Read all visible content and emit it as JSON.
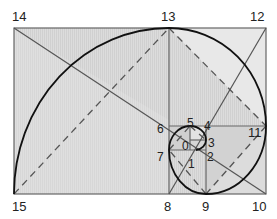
{
  "diagram": {
    "type": "golden-spiral",
    "colors": {
      "background": "#ffffff",
      "fill_light": "#e4e4e4",
      "fill_mid": "#d8d8d8",
      "fill_dark": "#c8c8c8",
      "stroke": "#555555",
      "spiral": "#111111",
      "dashed": "#555555"
    },
    "points": [
      {
        "id": "0",
        "label": "0"
      },
      {
        "id": "1",
        "label": "1"
      },
      {
        "id": "2",
        "label": "2"
      },
      {
        "id": "3",
        "label": "3"
      },
      {
        "id": "4",
        "label": "4"
      },
      {
        "id": "5",
        "label": "5"
      },
      {
        "id": "6",
        "label": "6"
      },
      {
        "id": "7",
        "label": "7"
      },
      {
        "id": "8",
        "label": "8"
      },
      {
        "id": "9",
        "label": "9"
      },
      {
        "id": "10",
        "label": "10"
      },
      {
        "id": "11",
        "label": "11"
      },
      {
        "id": "12",
        "label": "12"
      },
      {
        "id": "13",
        "label": "13"
      },
      {
        "id": "14",
        "label": "14"
      },
      {
        "id": "15",
        "label": "15"
      }
    ]
  }
}
